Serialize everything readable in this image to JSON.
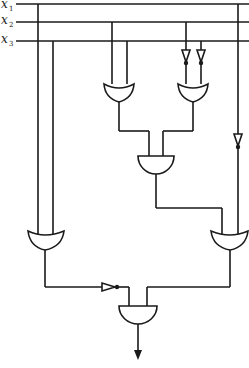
{
  "diagram": {
    "type": "logic-circuit",
    "inputs": [
      {
        "name": "x",
        "subscript": "1"
      },
      {
        "name": "x",
        "subscript": "2"
      },
      {
        "name": "x",
        "subscript": "3"
      }
    ],
    "gates": [
      {
        "id": "or-left-top",
        "type": "OR",
        "inputs": [
          "x2",
          "x3"
        ]
      },
      {
        "id": "or-right-top",
        "type": "OR",
        "inputs": [
          "NOT x2",
          "NOT x3"
        ]
      },
      {
        "id": "and-middle",
        "type": "AND",
        "inputs": [
          "or-left-top",
          "or-right-top"
        ]
      },
      {
        "id": "or-left-bottom",
        "type": "OR",
        "inputs": [
          "x1",
          "x3"
        ]
      },
      {
        "id": "or-right-bottom",
        "type": "OR",
        "inputs": [
          "and-middle",
          "NOT x1"
        ]
      },
      {
        "id": "and-output",
        "type": "AND",
        "inputs": [
          "NOT or-left-bottom",
          "or-right-bottom"
        ]
      }
    ],
    "inverters": 4,
    "output": "arrow-down"
  }
}
